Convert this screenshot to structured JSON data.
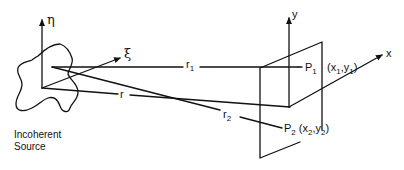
{
  "diagram": {
    "source": {
      "caption_line1": "Incoherent",
      "caption_line2": "Source",
      "axis_vertical": "η",
      "axis_oblique": "ξ"
    },
    "observation_plane": {
      "axis_vertical": "y",
      "axis_horizontal": "x",
      "point1": {
        "name": "P",
        "sub": "1",
        "coords": "(x",
        "coords_sub1": "1",
        "coords_mid": ",y",
        "coords_sub2": "1",
        "coords_end": ")"
      },
      "point2": {
        "name": "P",
        "sub": "2",
        "coords": "(x",
        "coords_sub1": "2",
        "coords_mid": ",y",
        "coords_sub2": "2",
        "coords_end": ")"
      }
    },
    "distances": {
      "r1": {
        "name": "r",
        "sub": "1"
      },
      "r2": {
        "name": "r",
        "sub": "2"
      },
      "r": {
        "name": "r"
      }
    }
  }
}
